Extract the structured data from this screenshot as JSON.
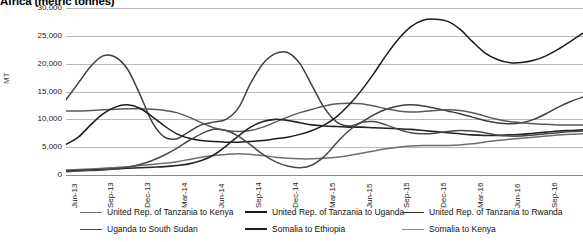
{
  "chart_data": {
    "type": "line",
    "title": "Africa (metric tonnes)",
    "xlabel": "",
    "ylabel": "MT",
    "ylim": [
      0,
      30000
    ],
    "ytick_labels": [
      "30,000",
      "25,000",
      "20,000",
      "15,000",
      "10,000",
      "5,000",
      "0"
    ],
    "ytick_values": [
      30000,
      25000,
      20000,
      15000,
      10000,
      5000,
      0
    ],
    "grid": true,
    "legend_position": "bottom",
    "x_tick_labels": [
      "Jun-13",
      "Sep-13",
      "Dec-13",
      "Mar-14",
      "Jun-14",
      "Sep-14",
      "Dec-14",
      "Mar-15",
      "Jun-15",
      "Sep-15",
      "Dec-15",
      "Mar-16",
      "Jun-16",
      "Sep-16",
      "Dec-16"
    ],
    "x": [
      "Jun-13",
      "Jul-13",
      "Aug-13",
      "Sep-13",
      "Oct-13",
      "Nov-13",
      "Dec-13",
      "Jan-14",
      "Feb-14",
      "Mar-14",
      "Apr-14",
      "May-14",
      "Jun-14",
      "Jul-14",
      "Aug-14",
      "Sep-14",
      "Oct-14",
      "Nov-14",
      "Dec-14",
      "Jan-15",
      "Feb-15",
      "Mar-15",
      "Apr-15",
      "May-15",
      "Jun-15",
      "Jul-15",
      "Aug-15",
      "Sep-15",
      "Oct-15",
      "Nov-15",
      "Dec-15",
      "Jan-16",
      "Feb-16",
      "Mar-16",
      "Apr-16",
      "May-16",
      "Jun-16",
      "Jul-16",
      "Aug-16",
      "Sep-16",
      "Oct-16",
      "Nov-16",
      "Dec-16"
    ],
    "series": [
      {
        "name": "United Rep. of Tanzania to Kenya",
        "color": "#3f3f3f",
        "width": 1.5,
        "values": [
          13500,
          16500,
          19500,
          21400,
          21200,
          19000,
          14500,
          9500,
          6800,
          6500,
          7800,
          9000,
          9500,
          10000,
          12000,
          16500,
          20000,
          21800,
          22000,
          20000,
          16000,
          12000,
          9500,
          8800,
          9500,
          10800,
          11800,
          12400,
          12600,
          12400,
          12000,
          11500,
          11000,
          10400,
          9800,
          9400,
          9200,
          9400,
          10000,
          11000,
          12200,
          13200,
          14000
        ]
      },
      {
        "name": "United Rep. of Tanzania to Uganda",
        "color": "#5a5a5a",
        "width": 1.5,
        "values": [
          11500,
          11500,
          11600,
          11700,
          11800,
          11900,
          11900,
          11800,
          11600,
          11200,
          10400,
          9400,
          8500,
          8000,
          7800,
          8000,
          8600,
          9500,
          10400,
          11200,
          11800,
          12400,
          12800,
          12900,
          12800,
          12400,
          11900,
          11500,
          11300,
          11400,
          11600,
          11700,
          11600,
          11200,
          10600,
          10000,
          9600,
          9400,
          9200,
          9100,
          9000,
          9000,
          9000
        ]
      },
      {
        "name": "United Rep. of Tanzania to Rwanda",
        "color": "#1c1c1c",
        "width": 1.5,
        "values": [
          5500,
          6800,
          9000,
          11000,
          12200,
          12600,
          12000,
          10500,
          8800,
          7400,
          6600,
          6200,
          6000,
          5900,
          5900,
          6000,
          6200,
          6500,
          6800,
          7300,
          8000,
          9000,
          10500,
          12600,
          15200,
          18200,
          21500,
          24400,
          26600,
          27800,
          28000,
          27600,
          26200,
          24000,
          22000,
          20800,
          20200,
          20200,
          20600,
          21400,
          22600,
          24000,
          25500
        ]
      },
      {
        "name": "Uganda to South Sudan",
        "color": "#6e6e6e",
        "width": 1.5,
        "values": [
          900,
          1000,
          1100,
          1200,
          1350,
          1500,
          1700,
          1900,
          2100,
          2400,
          2800,
          3200,
          3500,
          3700,
          3800,
          3700,
          3500,
          3200,
          3000,
          2900,
          2900,
          3000,
          3200,
          3500,
          3900,
          4300,
          4700,
          5000,
          5200,
          5300,
          5300,
          5300,
          5400,
          5600,
          5900,
          6200,
          6400,
          6600,
          6800,
          7000,
          7200,
          7300,
          7400
        ]
      },
      {
        "name": "Somalia to Ethiopia",
        "color": "#242424",
        "width": 1.6,
        "values": [
          700,
          800,
          900,
          1000,
          1100,
          1200,
          1300,
          1400,
          1500,
          1700,
          2000,
          2600,
          3600,
          5200,
          7000,
          8600,
          9600,
          10000,
          9800,
          9400,
          9000,
          8800,
          8700,
          8600,
          8600,
          8500,
          8400,
          8300,
          8200,
          8000,
          7800,
          7600,
          7400,
          7200,
          7100,
          7100,
          7200,
          7300,
          7500,
          7700,
          7900,
          8000,
          8100
        ]
      },
      {
        "name": "Somalia to Kenya",
        "color": "#4a4a4a",
        "width": 1.5,
        "values": [
          600,
          700,
          800,
          900,
          1100,
          1400,
          1900,
          2600,
          3600,
          4800,
          6200,
          7400,
          8200,
          8000,
          7000,
          5400,
          3700,
          2400,
          1600,
          1300,
          1800,
          3400,
          5800,
          8000,
          9400,
          9600,
          9000,
          8200,
          7600,
          7400,
          7500,
          7800,
          8000,
          7900,
          7600,
          7200,
          7000,
          7000,
          7200,
          7400,
          7600,
          7800,
          7900
        ]
      }
    ]
  },
  "legend": {
    "rows": [
      [
        {
          "label": "United Rep. of Tanzania to Kenya",
          "color": "#6a6a6a",
          "width": 1.4
        },
        {
          "label": "United Rep. of Tanzania to Uganda",
          "color": "#1c1c1c",
          "width": 2.0
        },
        {
          "label": "United Rep. of Tanzania to Rwanda",
          "color": "#2a2a2a",
          "width": 1.8
        }
      ],
      [
        {
          "label": "Uganda to South Sudan",
          "color": "#4a4a4a",
          "width": 1.6
        },
        {
          "label": "Somalia to Ethiopia",
          "color": "#1c1c1c",
          "width": 2.0
        },
        {
          "label": "Somalia to Kenya",
          "color": "#8a8a8a",
          "width": 1.4
        }
      ]
    ]
  }
}
